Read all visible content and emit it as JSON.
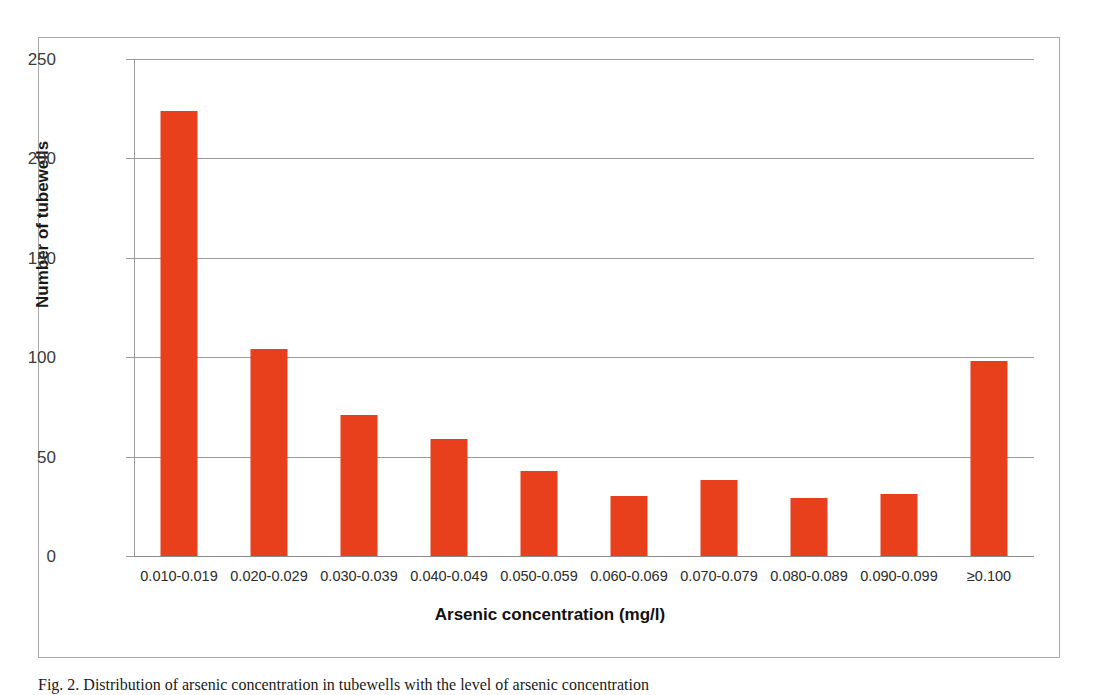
{
  "chart_data": {
    "type": "bar",
    "title": "",
    "xlabel": "Arsenic concentration (mg/l)",
    "ylabel": "Number of tubewells",
    "categories": [
      "0.010-0.019",
      "0.020-0.029",
      "0.030-0.039",
      "0.040-0.049",
      "0.050-0.059",
      "0.060-0.069",
      "0.070-0.079",
      "0.080-0.089",
      "0.090-0.099",
      "≥0.100"
    ],
    "values": [
      224,
      104,
      71,
      59,
      43,
      30,
      38,
      29,
      31,
      98
    ],
    "ylim": [
      0,
      250
    ],
    "yticks": [
      0,
      50,
      100,
      150,
      200,
      250
    ],
    "ytick_labels": [
      "0",
      "50",
      "100",
      "150",
      "200",
      "250"
    ],
    "grid": true,
    "legend": false,
    "bar_color": "#E8401C",
    "gridline_color": "#9A9A9A",
    "frame_color": "#A8A8A8"
  },
  "caption": {
    "text": "Fig. 2.  Distribution of arsenic concentration in tubewells with the level of arsenic concentration"
  }
}
